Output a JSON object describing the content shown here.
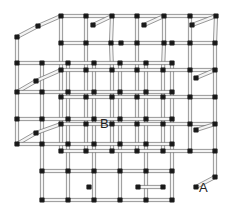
{
  "diagram": {
    "type": "3d-cubic-lattice",
    "labels": [
      {
        "id": "B",
        "text": "B",
        "x": 100,
        "y": 117
      },
      {
        "id": "A",
        "text": "A",
        "x": 199,
        "y": 181
      }
    ],
    "colors": {
      "background": "#ffffff",
      "tube_stroke": "#555555",
      "tube_fill": "#f4f4f4",
      "node": "#1a1a1a",
      "text": "#222222"
    },
    "offset": {
      "dx": 26,
      "dy": -10
    },
    "nodes": [
      [
        61,
        16
      ],
      [
        86,
        16
      ],
      [
        112,
        16
      ],
      [
        137,
        16
      ],
      [
        164,
        16
      ],
      [
        190,
        16
      ],
      [
        216,
        16
      ],
      [
        38,
        26
      ],
      [
        93,
        25
      ],
      [
        144,
        25
      ],
      [
        192,
        25
      ],
      [
        17,
        37
      ],
      [
        61,
        43
      ],
      [
        86,
        43
      ],
      [
        111,
        43
      ],
      [
        121,
        43
      ],
      [
        137,
        43
      ],
      [
        164,
        43
      ],
      [
        172,
        43
      ],
      [
        190,
        43
      ],
      [
        215,
        43
      ],
      [
        17,
        63
      ],
      [
        42,
        63
      ],
      [
        68,
        63
      ],
      [
        94,
        63
      ],
      [
        120,
        63
      ],
      [
        146,
        63
      ],
      [
        172,
        63
      ],
      [
        61,
        70
      ],
      [
        86,
        70
      ],
      [
        112,
        70
      ],
      [
        137,
        70
      ],
      [
        163,
        70
      ],
      [
        190,
        70
      ],
      [
        215,
        70
      ],
      [
        36,
        81
      ],
      [
        196,
        78
      ],
      [
        17,
        92
      ],
      [
        42,
        92
      ],
      [
        68,
        92
      ],
      [
        94,
        92
      ],
      [
        120,
        92
      ],
      [
        146,
        92
      ],
      [
        172,
        92
      ],
      [
        61,
        97
      ],
      [
        86,
        97
      ],
      [
        112,
        97
      ],
      [
        137,
        97
      ],
      [
        163,
        97
      ],
      [
        190,
        97
      ],
      [
        215,
        97
      ],
      [
        17,
        119
      ],
      [
        42,
        119
      ],
      [
        68,
        119
      ],
      [
        94,
        119
      ],
      [
        120,
        119
      ],
      [
        146,
        119
      ],
      [
        172,
        119
      ],
      [
        61,
        124
      ],
      [
        86,
        124
      ],
      [
        112,
        124
      ],
      [
        137,
        124
      ],
      [
        163,
        124
      ],
      [
        190,
        124
      ],
      [
        215,
        124
      ],
      [
        36,
        133
      ],
      [
        196,
        130
      ],
      [
        17,
        144
      ],
      [
        42,
        144
      ],
      [
        68,
        144
      ],
      [
        94,
        144
      ],
      [
        120,
        144
      ],
      [
        146,
        144
      ],
      [
        172,
        144
      ],
      [
        61,
        151
      ],
      [
        86,
        151
      ],
      [
        112,
        151
      ],
      [
        137,
        151
      ],
      [
        163,
        151
      ],
      [
        190,
        151
      ],
      [
        215,
        151
      ],
      [
        42,
        171
      ],
      [
        68,
        171
      ],
      [
        94,
        171
      ],
      [
        120,
        171
      ],
      [
        146,
        171
      ],
      [
        172,
        171
      ],
      [
        89,
        187
      ],
      [
        138,
        187
      ],
      [
        163,
        187
      ],
      [
        196,
        187
      ],
      [
        215,
        177
      ],
      [
        42,
        200
      ],
      [
        68,
        200
      ],
      [
        94,
        200
      ],
      [
        120,
        200
      ],
      [
        146,
        200
      ],
      [
        172,
        200
      ]
    ]
  }
}
